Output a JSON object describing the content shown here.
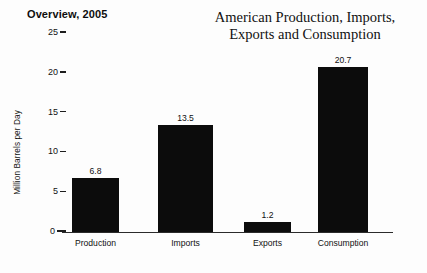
{
  "overview_label": "Overview, 2005",
  "title_lines": [
    "American Production, Imports,",
    "Exports and Consumption"
  ],
  "colors": {
    "bar": "#0c0c0c",
    "axis": "#2b2b2b",
    "text": "#111111",
    "background": "#fdfdfd"
  },
  "chart_data": {
    "type": "bar",
    "title": "American Production, Imports, Exports and Consumption",
    "subtitle": "Overview, 2005",
    "xlabel": "",
    "ylabel": "Million Barrels per Day",
    "categories": [
      "Production",
      "Imports",
      "Exports",
      "Consumption"
    ],
    "values": [
      6.8,
      13.5,
      1.2,
      20.7
    ],
    "value_labels": [
      "6.8",
      "13.5",
      "1.2",
      "20.7"
    ],
    "ylim": [
      0,
      25
    ],
    "yticks": [
      0,
      5,
      10,
      15,
      20,
      25
    ],
    "ytick_labels": [
      "0",
      "5",
      "10",
      "15",
      "20",
      "25"
    ],
    "grid": false,
    "legend": false
  }
}
